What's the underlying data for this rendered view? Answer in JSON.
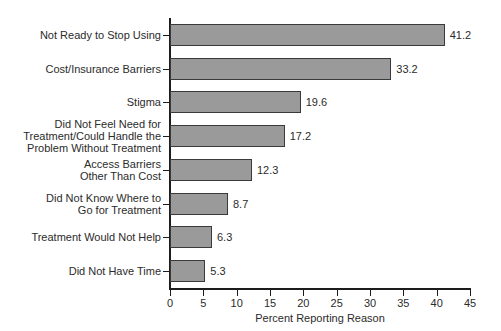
{
  "chart_data": {
    "type": "bar",
    "orientation": "horizontal",
    "title": "",
    "xlabel": "Percent Reporting Reason",
    "ylabel": "",
    "xlim": [
      0,
      45
    ],
    "xticks": [
      0,
      5,
      10,
      15,
      20,
      25,
      30,
      35,
      40,
      45
    ],
    "grid": false,
    "legend": null,
    "categories": [
      "Not Ready to Stop Using",
      "Cost/Insurance Barriers",
      "Stigma",
      "Did Not Feel Need for Treatment/Could Handle the Problem Without Treatment",
      "Access Barriers Other Than Cost",
      "Did Not Know Where to Go for Treatment",
      "Treatment Would Not Help",
      "Did Not Have Time"
    ],
    "values": [
      41.2,
      33.2,
      19.6,
      17.2,
      12.3,
      8.7,
      6.3,
      5.3
    ],
    "value_labels": [
      "41.2",
      "33.2",
      "19.6",
      "17.2",
      "12.3",
      "8.7",
      "6.3",
      "5.3"
    ],
    "category_label_lines": [
      [
        "Not Ready to Stop Using"
      ],
      [
        "Cost/Insurance Barriers"
      ],
      [
        "Stigma"
      ],
      [
        "Did Not Feel Need for",
        "Treatment/Could Handle the",
        "Problem Without Treatment"
      ],
      [
        "Access Barriers",
        "Other Than Cost"
      ],
      [
        "Did Not Know Where to",
        "Go for Treatment"
      ],
      [
        "Treatment Would Not Help"
      ],
      [
        "Did Not Have Time"
      ]
    ],
    "colors": {
      "bar_fill": "#9a9a9a",
      "bar_border": "#3a3a3a",
      "axis": "#1c1c1c",
      "text": "#2b2b2b",
      "background": "#ffffff"
    }
  }
}
